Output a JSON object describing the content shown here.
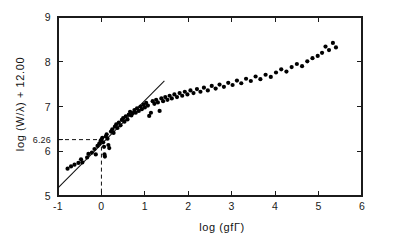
{
  "figure": {
    "background_color": "#ffffff",
    "ink_color": "#111111"
  },
  "chart_data": {
    "type": "scatter",
    "title": "",
    "subtitle": "",
    "xlabel": "log (gfΓ)",
    "ylabel": "log (W/λ) + 12.00",
    "xlim": [
      -1,
      6
    ],
    "ylim": [
      5,
      9
    ],
    "xticks": [
      -1,
      0,
      1,
      2,
      3,
      4,
      5,
      6
    ],
    "xtick_labels": [
      "-1",
      "0",
      "1",
      "2",
      "3",
      "4",
      "5",
      "6"
    ],
    "yticks": [
      5,
      6,
      7,
      8,
      9
    ],
    "ytick_labels": [
      "5",
      "6",
      "7",
      "8",
      "9"
    ],
    "special_ytick": 6.26,
    "special_ytick_label": "6.26",
    "grid": false,
    "legend": null,
    "annotations": [
      {
        "name": "linear-part-fit",
        "type": "line",
        "description": "straight line of unit slope fitted to the linear portion of the curve of growth",
        "x": [
          -1.0,
          1.45
        ],
        "y": [
          5.18,
          7.57
        ]
      },
      {
        "name": "intercept-guides",
        "type": "dashed-crosshair",
        "description": "dashed lines marking the ordinate 6.26 at abscissa 0",
        "x_value": 0,
        "y_value": 6.26
      }
    ],
    "series": [
      {
        "name": "measured lines",
        "marker": "filled-circle",
        "marker_size_px": 3.1,
        "color": "#000000",
        "points": [
          [
            -0.78,
            5.61
          ],
          [
            -0.7,
            5.66
          ],
          [
            -0.62,
            5.7
          ],
          [
            -0.53,
            5.74
          ],
          [
            -0.47,
            5.82
          ],
          [
            -0.44,
            5.75
          ],
          [
            -0.33,
            5.86
          ],
          [
            -0.3,
            5.94
          ],
          [
            -0.22,
            5.97
          ],
          [
            -0.16,
            6.05
          ],
          [
            -0.13,
            5.93
          ],
          [
            -0.09,
            6.12
          ],
          [
            -0.05,
            6.17
          ],
          [
            -0.02,
            6.23
          ],
          [
            0.0,
            6.26
          ],
          [
            0.02,
            6.3
          ],
          [
            0.04,
            6.2
          ],
          [
            0.06,
            6.1
          ],
          [
            0.07,
            5.93
          ],
          [
            0.08,
            5.88
          ],
          [
            0.1,
            6.33
          ],
          [
            0.12,
            6.38
          ],
          [
            0.14,
            6.28
          ],
          [
            0.16,
            6.14
          ],
          [
            0.18,
            6.07
          ],
          [
            0.22,
            6.44
          ],
          [
            0.25,
            6.49
          ],
          [
            0.28,
            6.41
          ],
          [
            0.31,
            6.55
          ],
          [
            0.34,
            6.6
          ],
          [
            0.37,
            6.52
          ],
          [
            0.4,
            6.64
          ],
          [
            0.44,
            6.58
          ],
          [
            0.47,
            6.7
          ],
          [
            0.5,
            6.74
          ],
          [
            0.53,
            6.66
          ],
          [
            0.56,
            6.78
          ],
          [
            0.6,
            6.71
          ],
          [
            0.63,
            6.82
          ],
          [
            0.66,
            6.88
          ],
          [
            0.69,
            6.8
          ],
          [
            0.72,
            6.85
          ],
          [
            0.76,
            6.92
          ],
          [
            0.79,
            6.86
          ],
          [
            0.82,
            6.96
          ],
          [
            0.86,
            6.9
          ],
          [
            0.9,
            7.0
          ],
          [
            0.93,
            6.94
          ],
          [
            0.97,
            7.04
          ],
          [
            1.0,
            6.98
          ],
          [
            1.03,
            7.08
          ],
          [
            1.07,
            7.02
          ],
          [
            1.1,
            6.79
          ],
          [
            1.14,
            6.86
          ],
          [
            1.18,
            7.12
          ],
          [
            1.22,
            7.06
          ],
          [
            1.26,
            7.15
          ],
          [
            1.3,
            7.09
          ],
          [
            1.34,
            6.9
          ],
          [
            1.38,
            7.18
          ],
          [
            1.42,
            7.12
          ],
          [
            1.47,
            7.21
          ],
          [
            1.52,
            7.15
          ],
          [
            1.57,
            7.24
          ],
          [
            1.62,
            7.18
          ],
          [
            1.68,
            7.27
          ],
          [
            1.74,
            7.21
          ],
          [
            1.8,
            7.3
          ],
          [
            1.86,
            7.24
          ],
          [
            1.92,
            7.33
          ],
          [
            1.98,
            7.27
          ],
          [
            2.05,
            7.36
          ],
          [
            2.12,
            7.3
          ],
          [
            2.2,
            7.39
          ],
          [
            2.28,
            7.33
          ],
          [
            2.36,
            7.42
          ],
          [
            2.45,
            7.36
          ],
          [
            2.54,
            7.46
          ],
          [
            2.63,
            7.4
          ],
          [
            2.72,
            7.49
          ],
          [
            2.82,
            7.44
          ],
          [
            2.92,
            7.53
          ],
          [
            3.02,
            7.48
          ],
          [
            3.12,
            7.58
          ],
          [
            3.22,
            7.52
          ],
          [
            3.33,
            7.62
          ],
          [
            3.44,
            7.57
          ],
          [
            3.55,
            7.67
          ],
          [
            3.66,
            7.61
          ],
          [
            3.78,
            7.71
          ],
          [
            3.9,
            7.66
          ],
          [
            4.02,
            7.76
          ],
          [
            4.14,
            7.83
          ],
          [
            4.26,
            7.78
          ],
          [
            4.38,
            7.88
          ],
          [
            4.5,
            7.95
          ],
          [
            4.62,
            7.9
          ],
          [
            4.74,
            8.01
          ],
          [
            4.86,
            8.08
          ],
          [
            4.98,
            8.13
          ],
          [
            5.08,
            8.2
          ],
          [
            5.16,
            8.34
          ],
          [
            5.24,
            8.26
          ],
          [
            5.33,
            8.42
          ],
          [
            5.4,
            8.32
          ]
        ]
      }
    ]
  }
}
